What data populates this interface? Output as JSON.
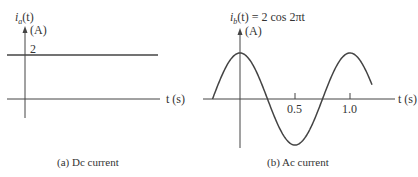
{
  "panel_a": {
    "y_label_italic": "i",
    "y_label_sub": "a",
    "y_label_rest": "(t)",
    "y_unit": "(A)",
    "level_label": "2",
    "x_label": "t (s)",
    "caption": "(a) Dc current"
  },
  "panel_b": {
    "y_label": "i",
    "y_label_sub": "b",
    "y_label_rest": "(t) = 2 cos 2πt",
    "y_unit": "(A)",
    "tick_1": "0.5",
    "tick_2": "1.0",
    "x_label": "t (s)",
    "caption": "(b) Ac current"
  },
  "chart_data": [
    {
      "type": "line",
      "title": "(a) Dc current",
      "xlabel": "t (s)",
      "ylabel": "i_a(t) (A)",
      "series": [
        {
          "name": "i_a(t)",
          "x": [
            -0.3,
            2.5
          ],
          "values": [
            2,
            2
          ]
        }
      ],
      "annotations": [
        "2"
      ]
    },
    {
      "type": "line",
      "title": "(b) Ac current",
      "xlabel": "t (s)",
      "ylabel": "i_b(t) (A)",
      "function": "i_b(t) = 2 cos 2πt",
      "x_ticks": [
        0.5,
        1.0
      ],
      "x_range": [
        -0.25,
        1.2
      ],
      "series": [
        {
          "name": "i_b(t)",
          "x": [
            -0.25,
            0,
            0.25,
            0.5,
            0.75,
            1.0,
            1.2
          ],
          "values": [
            0,
            2,
            0,
            -2,
            0,
            2,
            0.62
          ]
        }
      ]
    }
  ]
}
